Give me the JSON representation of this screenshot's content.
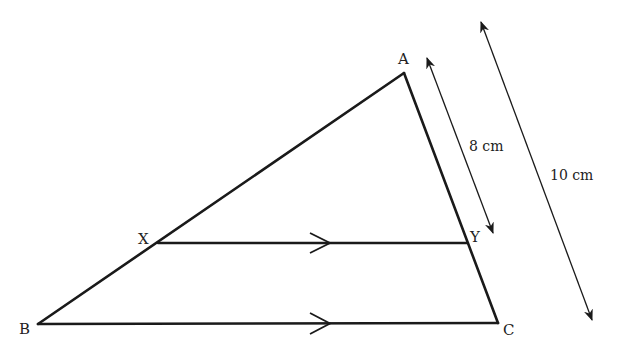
{
  "diagram": {
    "type": "geometry-similar-triangles",
    "colors": {
      "stroke": "#1a1a1a",
      "text": "#222222",
      "background": "#ffffff"
    },
    "points": {
      "A": {
        "label": "A",
        "x": 404,
        "y": 73
      },
      "B": {
        "label": "B",
        "x": 38,
        "y": 324
      },
      "C": {
        "label": "C",
        "x": 498,
        "y": 323
      },
      "X": {
        "label": "X",
        "x": 158,
        "y": 243
      },
      "Y": {
        "label": "Y",
        "x": 468,
        "y": 243
      }
    },
    "segments": [
      {
        "from": "A",
        "to": "B"
      },
      {
        "from": "A",
        "to": "C"
      },
      {
        "from": "B",
        "to": "C",
        "parallel_mark": true
      },
      {
        "from": "X",
        "to": "Y",
        "parallel_mark": true
      }
    ],
    "measurements": [
      {
        "label": "8 cm",
        "represents": "AY"
      },
      {
        "label": "10 cm",
        "represents": "AC"
      }
    ]
  }
}
